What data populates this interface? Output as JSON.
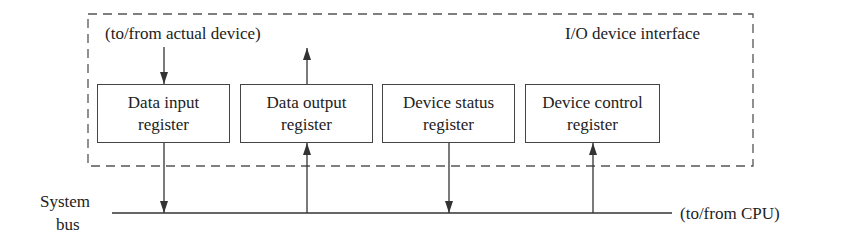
{
  "diagram": {
    "interface_label": "I/O device interface",
    "device_label": "(to/from actual device)",
    "cpu_label": "(to/from CPU)",
    "bus_label": {
      "line1": "System",
      "line2": "bus"
    },
    "registers": [
      {
        "line1": "Data input",
        "line2": "register",
        "bus_direction": "down",
        "device_direction": "in"
      },
      {
        "line1": "Data output",
        "line2": "register",
        "bus_direction": "up",
        "device_direction": "out"
      },
      {
        "line1": "Device status",
        "line2": "register",
        "bus_direction": "down"
      },
      {
        "line1": "Device control",
        "line2": "register",
        "bus_direction": "up"
      }
    ],
    "colors": {
      "line": "#444444",
      "text": "#222222",
      "background": "#ffffff"
    }
  }
}
